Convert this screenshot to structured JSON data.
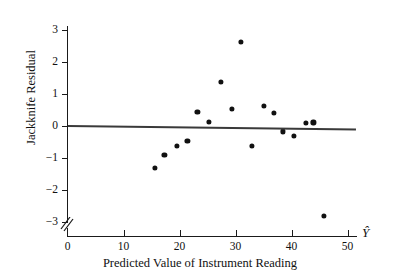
{
  "chart_data": {
    "type": "scatter",
    "title": "",
    "xlabel": "Predicted Value of Instrument Reading",
    "ylabel": "Jackknife Residual",
    "x_axis_symbol": "Ŷ",
    "xlim": [
      0,
      51.5
    ],
    "ylim": [
      -3.45,
      3.45
    ],
    "xticks": [
      0,
      10,
      20,
      30,
      40,
      50
    ],
    "xtick_labels": [
      "0",
      "10",
      "20",
      "30",
      "40",
      "50"
    ],
    "yticks": [
      -3,
      -2,
      -1,
      0,
      1,
      2,
      3
    ],
    "ytick_labels": [
      "-3",
      "-2",
      "-1",
      "0",
      "1",
      "2",
      "3"
    ],
    "grid": false,
    "legend": false,
    "axis_break": true,
    "marker_color": "#111111",
    "reference_line": {
      "name": "zero-residual-line",
      "x_start": 0,
      "y_start": 0.02,
      "x_end": 51.5,
      "y_end": -0.09,
      "color": "#3a3a3a"
    },
    "points": [
      {
        "x": 15.6,
        "y": -1.32
      },
      {
        "x": 17.3,
        "y": -0.9
      },
      {
        "x": 19.5,
        "y": -0.62
      },
      {
        "x": 21.4,
        "y": -0.46
      },
      {
        "x": 23.2,
        "y": 0.45
      },
      {
        "x": 25.2,
        "y": 0.13
      },
      {
        "x": 27.4,
        "y": 1.37
      },
      {
        "x": 29.4,
        "y": 0.54
      },
      {
        "x": 30.9,
        "y": 2.62
      },
      {
        "x": 32.9,
        "y": -0.61
      },
      {
        "x": 35.0,
        "y": 0.64
      },
      {
        "x": 36.9,
        "y": 0.42
      },
      {
        "x": 38.5,
        "y": -0.17
      },
      {
        "x": 40.5,
        "y": -0.32
      },
      {
        "x": 42.6,
        "y": 0.09
      },
      {
        "x": 43.9,
        "y": 0.11
      },
      {
        "x": 45.8,
        "y": -2.82
      }
    ]
  }
}
